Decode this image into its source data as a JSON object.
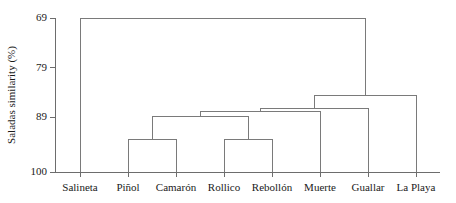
{
  "chart_data": {
    "type": "diagram",
    "subtype": "dendrogram",
    "title": "",
    "xlabel": "",
    "ylabel": "Saladas similarity (%)",
    "ylim": [
      69,
      100
    ],
    "y_axis_inverted": true,
    "grid": false,
    "legend": null,
    "y_ticks": [
      69,
      79,
      89,
      100
    ],
    "y_tick_labels": [
      "69",
      "79",
      "89",
      "100"
    ],
    "leaves": [
      "Salineta",
      "Piñol",
      "Camarón",
      "Rollico",
      "Rebollón",
      "Muerte",
      "Guallar",
      "La Playa"
    ],
    "merges": [
      {
        "id": "m1",
        "left": "Piñol",
        "right": "Camarón",
        "similarity": 93.5
      },
      {
        "id": "m2",
        "left": "Rollico",
        "right": "Rebollón",
        "similarity": 93.5
      },
      {
        "id": "m3",
        "left": "m1",
        "right": "m2",
        "similarity": 88.8
      },
      {
        "id": "m4",
        "left": "m3",
        "right": "Muerte",
        "similarity": 87.8
      },
      {
        "id": "m5",
        "left": "m4",
        "right": "Guallar",
        "similarity": 87.2
      },
      {
        "id": "m6",
        "left": "m5",
        "right": "La Playa",
        "similarity": 84.5
      },
      {
        "id": "m7",
        "left": "Salineta",
        "right": "m6",
        "similarity": 69.0
      }
    ],
    "axis_color": "#6d6d6d",
    "link_color": "#7a7a7a",
    "background_color": "#ffffff"
  },
  "layout": {
    "plot_left": 55,
    "plot_right": 440,
    "plot_top": 18,
    "plot_bottom": 172,
    "leaf_step": 48,
    "leaf_first": 80,
    "tick_length": 5,
    "xlabel_offset": 6,
    "ylabel_offset": 40
  }
}
